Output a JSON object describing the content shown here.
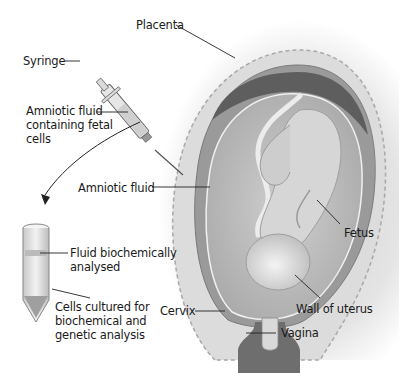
{
  "diagram": {
    "labels": {
      "placenta": "Placenta",
      "syringe": "Syringe",
      "amniotic_fluid_cells": "Amniotic fluid\ncontaining fetal\ncells",
      "amniotic_fluid": "Amniotic fluid",
      "fetus": "Fetus",
      "fluid_analysed": "Fluid biochemically\nanalysed",
      "cells_cultured": "Cells cultured for\nbiochemical and\ngenetic analysis",
      "cervix": "Cervix",
      "wall_of_uterus": "Wall of uterus",
      "vagina": "Vagina"
    },
    "colors": {
      "background": "#ffffff",
      "vignette": "#cfcfcf",
      "uterus_wall": "#9a9a9a",
      "placenta": "#5e5e5e",
      "amniotic_fluid": "#bdbdbd",
      "fetus": "#d6d6d6",
      "leader_line": "#222222"
    }
  }
}
